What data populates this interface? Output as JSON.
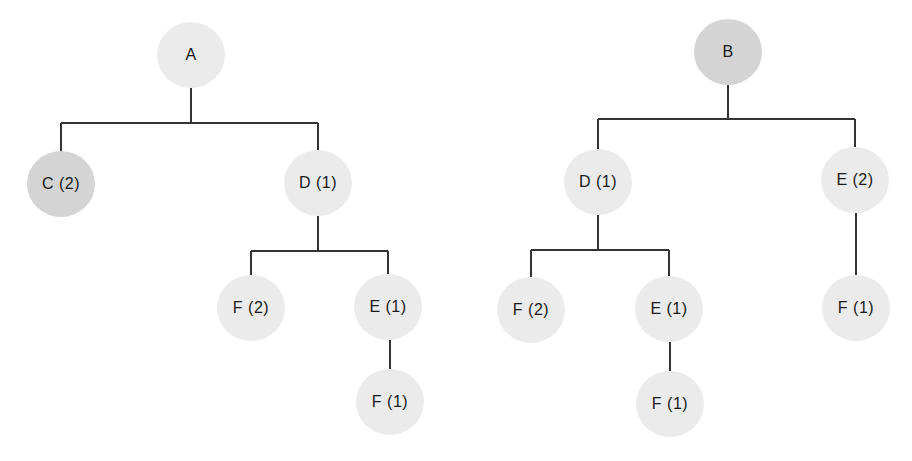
{
  "colors": {
    "light_node": "#ebebeb",
    "dark_node": "#d4d4d4",
    "edge": "#333333",
    "text": "#1a1a1a",
    "background": "#ffffff"
  },
  "trees": [
    {
      "name": "tree-a",
      "nodes": [
        {
          "id": "A",
          "label": "A",
          "x": 191,
          "y": 55,
          "shade": "light"
        },
        {
          "id": "C",
          "label": "C (2)",
          "x": 61,
          "y": 184,
          "shade": "dark"
        },
        {
          "id": "D",
          "label": "D (1)",
          "x": 318,
          "y": 183,
          "shade": "light"
        },
        {
          "id": "F2",
          "label": "F (2)",
          "x": 251,
          "y": 308,
          "shade": "light"
        },
        {
          "id": "E1",
          "label": "E (1)",
          "x": 388,
          "y": 307,
          "shade": "light"
        },
        {
          "id": "F1",
          "label": "F (1)",
          "x": 390,
          "y": 402,
          "shade": "light"
        }
      ],
      "edges": [
        {
          "parent": "A",
          "children": [
            "C",
            "D"
          ],
          "bar_y": 123
        },
        {
          "parent": "D",
          "children": [
            "F2",
            "E1"
          ],
          "bar_y": 251
        },
        {
          "parent": "E1",
          "children": [
            "F1"
          ],
          "bar_y": null
        }
      ]
    },
    {
      "name": "tree-b",
      "nodes": [
        {
          "id": "B",
          "label": "B",
          "x": 728,
          "y": 52,
          "shade": "dark"
        },
        {
          "id": "D",
          "label": "D (1)",
          "x": 598,
          "y": 182,
          "shade": "light"
        },
        {
          "id": "E2",
          "label": "E (2)",
          "x": 855,
          "y": 180,
          "shade": "light"
        },
        {
          "id": "F2",
          "label": "F (2)",
          "x": 531,
          "y": 310,
          "shade": "light"
        },
        {
          "id": "E1",
          "label": "E (1)",
          "x": 669,
          "y": 309,
          "shade": "light"
        },
        {
          "id": "F1a",
          "label": "F (1)",
          "x": 670,
          "y": 404,
          "shade": "light"
        },
        {
          "id": "F1b",
          "label": "F (1)",
          "x": 856,
          "y": 308,
          "shade": "light"
        }
      ],
      "edges": [
        {
          "parent": "B",
          "children": [
            "D",
            "E2"
          ],
          "bar_y": 119
        },
        {
          "parent": "D",
          "children": [
            "F2",
            "E1"
          ],
          "bar_y": 250
        },
        {
          "parent": "E1",
          "children": [
            "F1a"
          ],
          "bar_y": null
        },
        {
          "parent": "E2",
          "children": [
            "F1b"
          ],
          "bar_y": null
        }
      ]
    }
  ]
}
